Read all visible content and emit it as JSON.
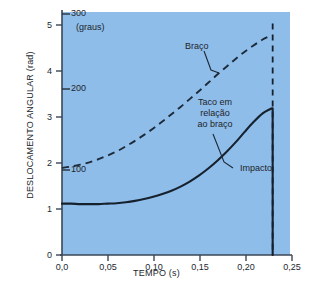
{
  "chart_data": {
    "type": "line",
    "title": "",
    "xlabel": "TEMPO (s)",
    "ylabel": "DESLOCAMENTO ANGULAR (rad)",
    "xlim": [
      0,
      0.25
    ],
    "ylim": [
      0,
      5.3
    ],
    "grid": false,
    "legend": "none",
    "background_color": "#8fbde9",
    "line_color": "#1c2a3a",
    "xticks": [
      0,
      0.05,
      0.1,
      0.15,
      0.2,
      0.25
    ],
    "xticklabels": [
      "0,0",
      "0,05",
      "0,10",
      "0,15",
      "0,20",
      "0,25"
    ],
    "yticks": [
      0,
      1,
      2,
      3,
      4,
      5
    ],
    "yticklabels": [
      "0",
      "1",
      "2",
      "3",
      "4",
      "5"
    ],
    "secondary_axis": {
      "unit_label": "(graus)",
      "ticks": [
        100,
        200,
        300
      ],
      "ticklabels": [
        "100",
        "200",
        "300"
      ],
      "tick_rad_positions": [
        1.745,
        3.491,
        5.236
      ]
    },
    "series": [
      {
        "name": "Braço",
        "style": "dashed",
        "points": [
          [
            0.0,
            1.9
          ],
          [
            0.01,
            1.93
          ],
          [
            0.02,
            1.97
          ],
          [
            0.03,
            2.02
          ],
          [
            0.04,
            2.09
          ],
          [
            0.05,
            2.17
          ],
          [
            0.06,
            2.26
          ],
          [
            0.07,
            2.37
          ],
          [
            0.08,
            2.49
          ],
          [
            0.09,
            2.62
          ],
          [
            0.1,
            2.76
          ],
          [
            0.11,
            2.91
          ],
          [
            0.12,
            3.07
          ],
          [
            0.13,
            3.23
          ],
          [
            0.14,
            3.4
          ],
          [
            0.15,
            3.57
          ],
          [
            0.16,
            3.75
          ],
          [
            0.17,
            3.93
          ],
          [
            0.18,
            4.1
          ],
          [
            0.19,
            4.27
          ],
          [
            0.2,
            4.43
          ],
          [
            0.21,
            4.57
          ],
          [
            0.22,
            4.7
          ],
          [
            0.23,
            4.8
          ]
        ]
      },
      {
        "name": "Taco em relação ao braço",
        "style": "solid",
        "points": [
          [
            0.0,
            1.12
          ],
          [
            0.01,
            1.12
          ],
          [
            0.02,
            1.11
          ],
          [
            0.03,
            1.11
          ],
          [
            0.04,
            1.11
          ],
          [
            0.05,
            1.12
          ],
          [
            0.06,
            1.13
          ],
          [
            0.07,
            1.15
          ],
          [
            0.08,
            1.18
          ],
          [
            0.09,
            1.22
          ],
          [
            0.1,
            1.27
          ],
          [
            0.11,
            1.33
          ],
          [
            0.12,
            1.4
          ],
          [
            0.13,
            1.49
          ],
          [
            0.14,
            1.6
          ],
          [
            0.15,
            1.73
          ],
          [
            0.16,
            1.88
          ],
          [
            0.17,
            2.05
          ],
          [
            0.18,
            2.24
          ],
          [
            0.19,
            2.45
          ],
          [
            0.2,
            2.68
          ],
          [
            0.21,
            2.9
          ],
          [
            0.22,
            3.09
          ],
          [
            0.228,
            3.18
          ],
          [
            0.231,
            3.2
          ]
        ]
      },
      {
        "name": "Impacto",
        "style": "dashed-vertical",
        "x": 0.231,
        "y_range": [
          0,
          5.05
        ]
      }
    ],
    "annotations": [
      {
        "name": "braco",
        "text": "Braço",
        "x": 0.148,
        "y": 4.3
      },
      {
        "name": "taco",
        "text": "Taco em\nrelação\nao braço",
        "x": 0.178,
        "y": 3.35
      },
      {
        "name": "impacto",
        "text": "Impacto",
        "x": 0.213,
        "y": 1.72
      }
    ]
  },
  "annotations": {
    "braco_label": "Braço",
    "taco_line1": "Taco em",
    "taco_line2": "relação",
    "taco_line3": "ao braço",
    "impacto_label": "Impacto",
    "graus_label": "(graus)"
  }
}
